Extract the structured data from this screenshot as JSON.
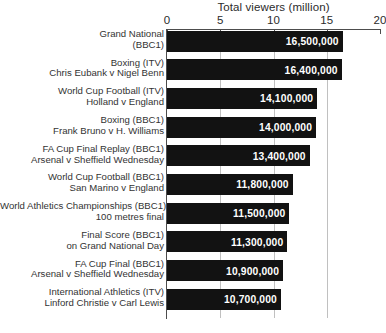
{
  "chart_data": {
    "type": "bar",
    "orientation": "horizontal",
    "title": "Total viewers (million)",
    "xlabel": "Total viewers (million)",
    "ylabel": "",
    "xlim": [
      0,
      20
    ],
    "xticks": [
      0,
      5,
      10,
      15,
      20
    ],
    "xtick_labels": [
      "0",
      "5",
      "10",
      "15",
      "20"
    ],
    "grid": true,
    "legend": false,
    "bar_color": "#121212",
    "value_label_color": "#ffffff",
    "categories": [
      "Grand National (BBC1)",
      "Boxing (ITV) Chris Eubank v Nigel Benn",
      "World Cup Football (ITV) Holland v England",
      "Boxing (BBC1) Frank Bruno v H. Williams",
      "FA Cup Final Replay (BBC1) Arsenal v Sheffield Wednesday",
      "World Cup Football (BBC1) San Marino v England",
      "World Athletics Championships (BBC1) 100 metres final",
      "Final Score (BBC1) on Grand National Day",
      "FA Cup Final (BBC1) Arsenal v Sheffield Wednesday",
      "International Athletics (ITV) Linford Christie v Carl Lewis"
    ],
    "values": [
      16.5,
      16.4,
      14.1,
      14.0,
      13.4,
      11.8,
      11.5,
      11.3,
      10.9,
      10.7
    ],
    "value_labels": [
      "16,500,000",
      "16,400,000",
      "14,100,000",
      "14,000,000",
      "13,400,000",
      "11,800,000",
      "11,500,000",
      "11,300,000",
      "10,900,000",
      "10,700,000"
    ]
  },
  "rows": [
    {
      "line1": "Grand National",
      "line2": "(BBC1)",
      "value": 16.5,
      "value_label": "16,500,000"
    },
    {
      "line1": "Boxing (ITV)",
      "line2": "Chris Eubank v Nigel Benn",
      "value": 16.4,
      "value_label": "16,400,000"
    },
    {
      "line1": "World Cup Football (ITV)",
      "line2": "Holland v England",
      "value": 14.1,
      "value_label": "14,100,000"
    },
    {
      "line1": "Boxing (BBC1)",
      "line2": "Frank Bruno v H. Williams",
      "value": 14.0,
      "value_label": "14,000,000"
    },
    {
      "line1": "FA Cup Final Replay (BBC1)",
      "line2": "Arsenal v Sheffield Wednesday",
      "value": 13.4,
      "value_label": "13,400,000"
    },
    {
      "line1": "World Cup Football (BBC1)",
      "line2": "San Marino v England",
      "value": 11.8,
      "value_label": "11,800,000"
    },
    {
      "line1": "World Athletics Championships (BBC1)",
      "line2": "100 metres final",
      "value": 11.5,
      "value_label": "11,500,000"
    },
    {
      "line1": "Final Score (BBC1)",
      "line2": "on Grand National Day",
      "value": 11.3,
      "value_label": "11,300,000"
    },
    {
      "line1": "FA Cup Final (BBC1)",
      "line2": "Arsenal v Sheffield Wednesday",
      "value": 10.9,
      "value_label": "10,900,000"
    },
    {
      "line1": "International Athletics (ITV)",
      "line2": "Linford Christie v Carl Lewis",
      "value": 10.7,
      "value_label": "10,700,000"
    }
  ]
}
